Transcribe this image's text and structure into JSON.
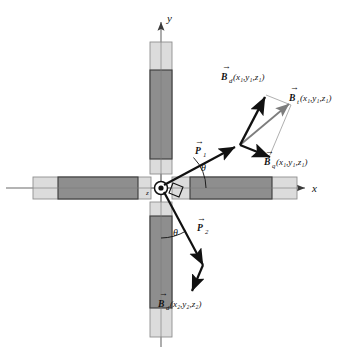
{
  "figure": {
    "background_color": "#ffffff",
    "width": 349,
    "height": 353
  },
  "axes": {
    "x_label": "x",
    "y_label": "y",
    "z_label": "z",
    "axis_color": "#5a5a5a",
    "origin": {
      "x": 161,
      "y": 188
    }
  },
  "rods": {
    "outer_color": "#dcdcdc",
    "outer_stroke": "#8a8a8a",
    "inner_color": "#8e8e8e",
    "inner_stroke": "#3c3c3c",
    "arms": [
      {
        "name": "arm-up",
        "orientation": "vertical"
      },
      {
        "name": "arm-down",
        "orientation": "vertical"
      },
      {
        "name": "arm-left",
        "orientation": "horizontal"
      },
      {
        "name": "arm-right",
        "orientation": "horizontal"
      }
    ]
  },
  "vectors": {
    "p1": {
      "label_main": "P",
      "label_sub": "1",
      "overbar": "→",
      "color": "#111111"
    },
    "p2": {
      "label_main": "P",
      "label_sub": "2",
      "overbar": "→",
      "color": "#111111"
    },
    "bd1": {
      "label_main": "B",
      "label_sub": "d",
      "args": "(x₁,y₁,z₁)",
      "overbar": "→",
      "color": "#111111"
    },
    "bq1": {
      "label_main": "B",
      "label_sub": "q",
      "args": "(x₁,y₁,z₁)",
      "overbar": "→",
      "color": "#111111"
    },
    "bt1": {
      "label_main": "B",
      "label_sub": "t",
      "args": "(x₁,y₁,z₁)",
      "overbar": "→",
      "color": "#6f6f6f"
    },
    "bd2": {
      "label_main": "B",
      "label_sub": "d",
      "args": "(x₂,y₂,z₂)",
      "overbar": "→",
      "color": "#111111"
    }
  },
  "angles": {
    "theta_upper": "θ",
    "theta_lower": "θ",
    "right_angle_marker": true
  },
  "colors": {
    "line_black": "#111111",
    "line_gray": "#8b8b8b",
    "axis_gray": "#6b6b6b",
    "rod_light": "#dcdcdc",
    "rod_dark": "#8e8e8e"
  }
}
